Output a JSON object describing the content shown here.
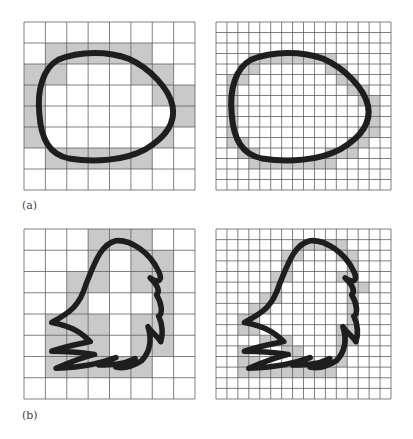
{
  "figure": {
    "labels": {
      "a": "(a)",
      "b": "(b)"
    },
    "colors": {
      "fill": "#c9c9c9",
      "grid": "#555555",
      "curve": "#1e1e1e",
      "background": "#ffffff"
    },
    "panels": [
      {
        "id": "a-coarse",
        "x": 24,
        "y": 22,
        "w": 171,
        "h": 168,
        "cells": 8,
        "filled": [
          [
            1,
            1
          ],
          [
            1,
            2
          ],
          [
            1,
            3
          ],
          [
            1,
            4
          ],
          [
            1,
            5
          ],
          [
            2,
            0
          ],
          [
            2,
            1
          ],
          [
            2,
            5
          ],
          [
            2,
            6
          ],
          [
            3,
            0
          ],
          [
            3,
            6
          ],
          [
            3,
            7
          ],
          [
            4,
            0
          ],
          [
            4,
            7
          ],
          [
            5,
            0
          ],
          [
            5,
            6
          ],
          [
            6,
            1
          ],
          [
            6,
            2
          ],
          [
            6,
            3
          ],
          [
            6,
            4
          ],
          [
            6,
            5
          ]
        ],
        "curve": "M 0.72 4.4 C 0.6 3.2 0.9 2.2 1.6 1.8 C 2.6 1.35 4.0 1.4 4.9 1.75 C 5.9 2.2 6.8 3.2 6.95 4.0 C 7.1 4.8 6.6 5.5 5.7 6.05 C 4.7 6.6 3.3 6.7 2.1 6.5 C 1.2 6.3 0.8 5.6 0.72 4.4 Z",
        "stroke": 0.28
      },
      {
        "id": "a-fine",
        "x": 216,
        "y": 22,
        "w": 175,
        "h": 168,
        "cells": 16,
        "filled": [
          [
            3,
            3
          ],
          [
            3,
            4
          ],
          [
            3,
            5
          ],
          [
            3,
            6
          ],
          [
            3,
            7
          ],
          [
            3,
            8
          ],
          [
            3,
            9
          ],
          [
            3,
            10
          ],
          [
            4,
            2
          ],
          [
            4,
            3
          ],
          [
            4,
            10
          ],
          [
            4,
            11
          ],
          [
            5,
            1
          ],
          [
            5,
            2
          ],
          [
            5,
            11
          ],
          [
            5,
            12
          ],
          [
            6,
            1
          ],
          [
            6,
            12
          ],
          [
            6,
            13
          ],
          [
            7,
            1
          ],
          [
            7,
            13
          ],
          [
            7,
            14
          ],
          [
            8,
            1
          ],
          [
            8,
            14
          ],
          [
            9,
            1
          ],
          [
            9,
            14
          ],
          [
            10,
            1
          ],
          [
            10,
            13
          ],
          [
            10,
            14
          ],
          [
            11,
            1
          ],
          [
            11,
            2
          ],
          [
            11,
            12
          ],
          [
            11,
            13
          ],
          [
            12,
            2
          ],
          [
            12,
            3
          ],
          [
            12,
            10
          ],
          [
            12,
            11
          ],
          [
            12,
            12
          ],
          [
            13,
            3
          ],
          [
            13,
            4
          ],
          [
            13,
            5
          ],
          [
            13,
            6
          ],
          [
            13,
            7
          ],
          [
            13,
            8
          ],
          [
            13,
            9
          ],
          [
            13,
            10
          ]
        ],
        "curve": "M 1.44 8.8 C 1.2 6.4 1.8 4.4 3.2 3.6 C 5.2 2.7 8.0 2.8 9.8 3.5 C 11.8 4.4 13.6 6.4 13.9 8.0 C 14.2 9.6 13.2 11.0 11.4 12.1 C 9.4 13.2 6.6 13.4 4.2 13.0 C 2.4 12.6 1.6 11.2 1.44 8.8 Z",
        "stroke": 0.56
      },
      {
        "id": "b-coarse",
        "x": 24,
        "y": 229,
        "w": 171,
        "h": 170,
        "cells": 8,
        "filled": [
          [
            0,
            3
          ],
          [
            0,
            4
          ],
          [
            0,
            5
          ],
          [
            1,
            3
          ],
          [
            1,
            5
          ],
          [
            1,
            6
          ],
          [
            2,
            2
          ],
          [
            2,
            3
          ],
          [
            2,
            5
          ],
          [
            2,
            6
          ],
          [
            3,
            2
          ],
          [
            3,
            6
          ],
          [
            4,
            1
          ],
          [
            4,
            2
          ],
          [
            4,
            3
          ],
          [
            4,
            5
          ],
          [
            4,
            6
          ],
          [
            5,
            1
          ],
          [
            5,
            2
          ],
          [
            5,
            3
          ],
          [
            5,
            5
          ],
          [
            5,
            6
          ],
          [
            6,
            1
          ],
          [
            6,
            2
          ],
          [
            6,
            3
          ],
          [
            6,
            4
          ],
          [
            6,
            5
          ]
        ],
        "curve": "M 1.3 4.4 C 2.2 3.9 2.6 3.6 2.9 2.6 C 3.3 1.6 3.6 0.7 4.3 0.55 C 5.0 0.5 5.9 1.1 6.3 2.0 C 6.5 2.4 6.3 2.6 5.9 2.3 C 6.2 2.6 6.4 2.9 6.2 3.1 C 6.45 3.5 6.5 4.0 6.3 4.1 C 6.5 4.5 6.5 5.0 6.4 5.3 C 6.2 5.0 5.9 4.8 5.8 4.6 C 6.0 5.2 5.9 5.8 5.5 6.2 C 5.2 6.4 4.8 6.6 4.3 6.5 L 5.2 6.1 C 4.6 6.4 4.0 6.4 3.5 6.4 L 4.3 6.05 C 3.6 6.3 2.9 6.5 1.5 6.55 C 2.3 6.2 2.9 6.0 3.3 5.9 C 2.6 5.8 2.0 5.75 1.3 5.75 C 2.0 5.5 2.6 5.4 3.1 5.3 C 2.8 5.0 2.4 4.6 1.3 4.4 Z",
        "stroke": 0.26
      },
      {
        "id": "b-fine",
        "x": 216,
        "y": 229,
        "w": 175,
        "h": 170,
        "cells": 16,
        "filled": [
          [
            1,
            7
          ],
          [
            1,
            8
          ],
          [
            1,
            9
          ],
          [
            1,
            10
          ],
          [
            1,
            11
          ],
          [
            2,
            6
          ],
          [
            2,
            7
          ],
          [
            2,
            11
          ],
          [
            2,
            12
          ],
          [
            3,
            6
          ],
          [
            3,
            12
          ],
          [
            4,
            5
          ],
          [
            4,
            6
          ],
          [
            4,
            11
          ],
          [
            4,
            12
          ],
          [
            5,
            5
          ],
          [
            5,
            12
          ],
          [
            5,
            13
          ],
          [
            6,
            4
          ],
          [
            6,
            5
          ],
          [
            6,
            12
          ],
          [
            7,
            3
          ],
          [
            7,
            4
          ],
          [
            7,
            12
          ],
          [
            8,
            2
          ],
          [
            8,
            3
          ],
          [
            8,
            12
          ],
          [
            9,
            2
          ],
          [
            9,
            3
          ],
          [
            9,
            11
          ],
          [
            9,
            12
          ],
          [
            10,
            4
          ],
          [
            10,
            5
          ],
          [
            10,
            6
          ],
          [
            10,
            11
          ],
          [
            10,
            12
          ],
          [
            11,
            2
          ],
          [
            11,
            6
          ],
          [
            11,
            7
          ],
          [
            11,
            11
          ],
          [
            12,
            2
          ],
          [
            12,
            3
          ],
          [
            12,
            7
          ],
          [
            12,
            8
          ],
          [
            12,
            10
          ],
          [
            12,
            11
          ],
          [
            13,
            2
          ],
          [
            13,
            3
          ],
          [
            13,
            4
          ],
          [
            13,
            5
          ],
          [
            13,
            6
          ],
          [
            13,
            7
          ],
          [
            13,
            8
          ],
          [
            13,
            9
          ],
          [
            13,
            10
          ]
        ],
        "curve": "M 2.6 8.8 C 4.4 7.8 5.2 7.2 5.8 5.2 C 6.6 3.2 7.2 1.4 8.6 1.1 C 10.0 1.0 11.8 2.2 12.6 4.0 C 13.0 4.8 12.6 5.2 11.8 4.6 C 12.4 5.2 12.8 5.8 12.4 6.2 C 12.9 7.0 13.0 8.0 12.6 8.2 C 13.0 9.0 13.0 10.0 12.8 10.6 C 12.4 10.0 11.8 9.6 11.6 9.2 C 12.0 10.4 11.8 11.6 11.0 12.4 C 10.4 12.8 9.6 13.2 8.6 13.0 L 10.4 12.2 C 9.2 12.8 8.0 12.8 7.0 12.8 L 8.6 12.1 C 7.2 12.6 5.8 13.0 3.0 13.1 C 4.6 12.4 5.8 12.0 6.6 11.8 C 5.2 11.6 4.0 11.5 2.6 11.5 C 4.0 11.0 5.2 10.8 6.2 10.6 C 5.6 10.0 4.8 9.2 2.6 8.8 Z",
        "stroke": 0.52
      }
    ]
  }
}
